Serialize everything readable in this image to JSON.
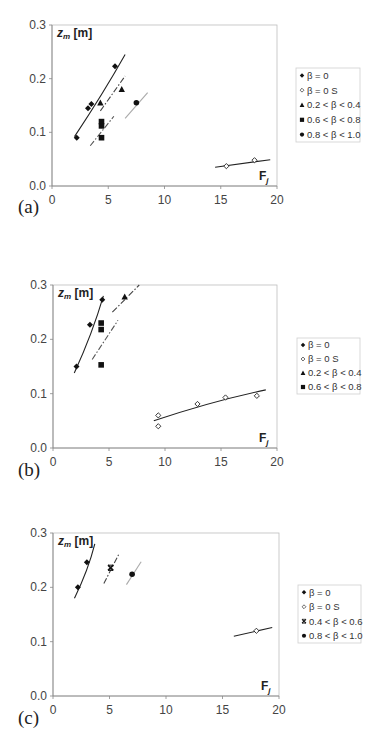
{
  "chart_data": [
    {
      "panel_label": "(a)",
      "type": "scatter",
      "title": "",
      "xlabel": "Fj",
      "ylabel": "zm [m]",
      "xlim": [
        0,
        20
      ],
      "ylim": [
        0,
        0.3
      ],
      "xticks": [
        "0",
        "5",
        "10",
        "15",
        "20"
      ],
      "yticks": [
        "0.0",
        "0.1",
        "0.2",
        "0.3"
      ],
      "grid": false,
      "legend_position": "right",
      "series": [
        {
          "name": "β = 0",
          "marker": "diamond-filled",
          "points": [
            [
              2.2,
              0.09
            ],
            [
              3.2,
              0.145
            ],
            [
              3.5,
              0.153
            ],
            [
              5.6,
              0.223
            ]
          ],
          "fit": {
            "style": "solid",
            "color": "#222",
            "from": [
              2.0,
              0.092
            ],
            "to": [
              6.5,
              0.245
            ],
            "curve": true
          }
        },
        {
          "name": "β = 0 S",
          "marker": "diamond-open",
          "points": [
            [
              15.5,
              0.037
            ],
            [
              18.0,
              0.048
            ]
          ],
          "fit": {
            "style": "solid",
            "color": "#222",
            "from": [
              14.5,
              0.035
            ],
            "to": [
              19.4,
              0.049
            ],
            "curve": false
          }
        },
        {
          "name": "0.2 < β < 0.4",
          "marker": "triangle",
          "points": [
            [
              4.3,
              0.155
            ],
            [
              6.2,
              0.18
            ]
          ],
          "fit": {
            "style": "dashdot",
            "color": "#444",
            "from": [
              4.3,
              0.14
            ],
            "to": [
              6.5,
              0.205
            ],
            "curve": false
          }
        },
        {
          "name": "0.6 < β < 0.8",
          "marker": "square",
          "points": [
            [
              4.4,
              0.12
            ],
            [
              4.4,
              0.112
            ],
            [
              4.4,
              0.09
            ]
          ],
          "fit": {
            "style": "dashdot",
            "color": "#555",
            "from": [
              3.4,
              0.075
            ],
            "to": [
              5.5,
              0.13
            ],
            "curve": false
          }
        },
        {
          "name": "0.8 < β < 1.0",
          "marker": "circle",
          "points": [
            [
              7.5,
              0.155
            ]
          ],
          "fit": {
            "style": "solid",
            "color": "#aaa",
            "from": [
              6.5,
              0.126
            ],
            "to": [
              8.5,
              0.174
            ],
            "curve": false
          }
        }
      ]
    },
    {
      "panel_label": "(b)",
      "type": "scatter",
      "title": "",
      "xlabel": "Fj",
      "ylabel": "zm [m]",
      "xlim": [
        0,
        20
      ],
      "ylim": [
        0,
        0.3
      ],
      "xticks": [
        "0",
        "5",
        "10",
        "15",
        "20"
      ],
      "yticks": [
        "0.0",
        "0.1",
        "0.2",
        "0.3"
      ],
      "grid": false,
      "legend_position": "right",
      "series": [
        {
          "name": "β = 0",
          "marker": "diamond-filled",
          "points": [
            [
              2.1,
              0.15
            ],
            [
              3.3,
              0.227
            ],
            [
              4.4,
              0.273
            ]
          ],
          "fit": {
            "style": "solid",
            "color": "#222",
            "from": [
              1.9,
              0.138
            ],
            "to": [
              4.5,
              0.28
            ],
            "curve": true
          }
        },
        {
          "name": "β = 0 S",
          "marker": "diamond-open",
          "points": [
            [
              9.4,
              0.06
            ],
            [
              9.4,
              0.04
            ],
            [
              12.9,
              0.081
            ],
            [
              15.4,
              0.093
            ],
            [
              18.2,
              0.096
            ]
          ],
          "fit": {
            "style": "solid",
            "color": "#222",
            "from": [
              9.0,
              0.05
            ],
            "to": [
              19.0,
              0.107
            ],
            "curve": true
          }
        },
        {
          "name": "0.2 < β < 0.4",
          "marker": "triangle",
          "points": [
            [
              6.4,
              0.278
            ]
          ],
          "fit": {
            "style": "dashdot",
            "color": "#444",
            "from": [
              5.3,
              0.25
            ],
            "to": [
              7.7,
              0.3
            ],
            "curve": true
          }
        },
        {
          "name": "0.6 < β < 0.8",
          "marker": "square",
          "points": [
            [
              4.3,
              0.23
            ],
            [
              4.3,
              0.218
            ],
            [
              4.3,
              0.153
            ]
          ],
          "fit": {
            "style": "dashdot",
            "color": "#555",
            "from": [
              3.5,
              0.163
            ],
            "to": [
              5.8,
              0.235
            ],
            "curve": false
          }
        }
      ]
    },
    {
      "panel_label": "(c)",
      "type": "scatter",
      "title": "",
      "xlabel": "Fj",
      "ylabel": "zm [m]",
      "xlim": [
        0,
        20
      ],
      "ylim": [
        0,
        0.3
      ],
      "xticks": [
        "0",
        "5",
        "10",
        "15",
        "20"
      ],
      "yticks": [
        "0.0",
        "0.1",
        "0.2",
        "0.3"
      ],
      "grid": false,
      "legend_position": "right",
      "series": [
        {
          "name": "β = 0",
          "marker": "diamond-filled",
          "points": [
            [
              2.2,
              0.2
            ],
            [
              3.0,
              0.246
            ]
          ],
          "fit": {
            "style": "solid",
            "color": "#222",
            "from": [
              1.9,
              0.18
            ],
            "to": [
              3.7,
              0.28
            ],
            "curve": true
          }
        },
        {
          "name": "β = 0 S",
          "marker": "diamond-open",
          "points": [
            [
              18.0,
              0.12
            ]
          ],
          "fit": {
            "style": "solid",
            "color": "#222",
            "from": [
              16.0,
              0.11
            ],
            "to": [
              19.4,
              0.126
            ],
            "curve": false
          }
        },
        {
          "name": "0.4 < β < 0.6",
          "marker": "cross",
          "points": [
            [
              5.1,
              0.236
            ]
          ],
          "fit": {
            "style": "dashdot",
            "color": "#444",
            "from": [
              4.5,
              0.207
            ],
            "to": [
              5.8,
              0.26
            ],
            "curve": false
          }
        },
        {
          "name": "0.8 < β < 1.0",
          "marker": "circle",
          "points": [
            [
              7.0,
              0.224
            ]
          ],
          "fit": {
            "style": "solid",
            "color": "#aaa",
            "from": [
              6.5,
              0.205
            ],
            "to": [
              7.8,
              0.247
            ],
            "curve": false
          }
        }
      ]
    }
  ],
  "layout_boxes": [
    {
      "plot": [
        52,
        25,
        277,
        186
      ],
      "legend": [
        296,
        68,
        64,
        74
      ],
      "panel_xy": [
        18,
        213
      ]
    },
    {
      "plot": [
        53,
        285,
        277,
        448
      ],
      "legend": [
        297,
        338,
        63,
        56
      ],
      "panel_xy": [
        18,
        476
      ]
    },
    {
      "plot": [
        53,
        533,
        279,
        696
      ],
      "legend": [
        298,
        585,
        63,
        58
      ],
      "panel_xy": [
        18,
        724
      ]
    }
  ]
}
